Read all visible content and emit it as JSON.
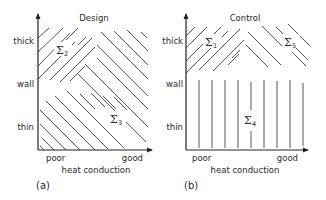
{
  "panels": [
    {
      "id": "a",
      "title": "Design",
      "caption": "(a)",
      "y_axis": {
        "ticks": [
          "thick",
          "wall",
          "thin"
        ]
      },
      "x_axis": {
        "ticks": [
          "poor",
          "good"
        ],
        "label": "heat conduction"
      },
      "regions": [
        {
          "symbol": "Σ",
          "index": "2",
          "hatch": "diagonal-up",
          "location": "upper-left"
        },
        {
          "symbol": "Σ",
          "index": "3",
          "hatch": "diagonal-down",
          "location": "lower-right"
        }
      ]
    },
    {
      "id": "b",
      "title": "Control",
      "caption": "(b)",
      "y_axis": {
        "ticks": [
          "thick",
          "wall",
          "thin"
        ]
      },
      "x_axis": {
        "ticks": [
          "poor",
          "good"
        ],
        "label": "heat conduction"
      },
      "regions": [
        {
          "symbol": "Σ",
          "index": "1",
          "hatch": "diagonal-up",
          "location": "upper-left"
        },
        {
          "symbol": "Σ",
          "index": "5",
          "hatch": "diagonal-down",
          "location": "upper-right"
        },
        {
          "symbol": "Σ",
          "index": "4",
          "hatch": "vertical",
          "location": "lower"
        }
      ]
    }
  ]
}
